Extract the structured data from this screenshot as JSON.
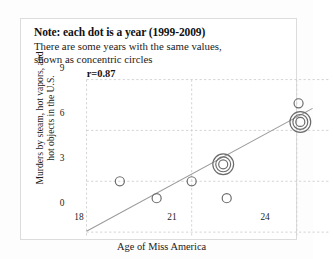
{
  "card": {
    "note_title": "Note: each dot is a year (1999-2009)",
    "note_line1": "There are some years with the same values,",
    "note_line2": "shown as concentric circles"
  },
  "chart_data": {
    "type": "scatter",
    "title": "Note: each dot is a year (1999-2009)",
    "subtitle": "There are some years with the same values, shown as concentric circles",
    "xlabel": "Age of Miss America",
    "ylabel": "Murders by steam, hot vapors, and hot objects in the U.S.",
    "xlim": [
      18,
      24.9
    ],
    "ylim": [
      0,
      9
    ],
    "xticks": [
      18,
      21,
      24
    ],
    "xtick_labels": [
      "18",
      "21",
      "24"
    ],
    "yticks": [
      0,
      3,
      6,
      9
    ],
    "ytick_labels": [
      "0",
      "3",
      "6",
      "9"
    ],
    "grid": true,
    "grid_style": "dashed",
    "legend": "none",
    "annotations": [
      {
        "text": "r=0.87",
        "x": 18.25,
        "y": 8.6,
        "bold": true
      }
    ],
    "marker": "open-circle",
    "marker_color": "#6b6b6b",
    "points": [
      {
        "x": 18.95,
        "y": 3.0,
        "count": 1
      },
      {
        "x": 20.0,
        "y": 2.0,
        "count": 1
      },
      {
        "x": 21.0,
        "y": 3.0,
        "count": 1
      },
      {
        "x": 21.9,
        "y": 4.0,
        "count": 3
      },
      {
        "x": 22.0,
        "y": 2.0,
        "count": 1
      },
      {
        "x": 24.1,
        "y": 6.5,
        "count": 3
      },
      {
        "x": 24.05,
        "y": 7.6,
        "count": 1
      }
    ],
    "trendline": {
      "visible": true,
      "color": "#9a9a9a",
      "x0": 18.0,
      "y0": 0.05,
      "x1": 24.45,
      "y1": 7.3
    },
    "correlation": 0.87
  }
}
